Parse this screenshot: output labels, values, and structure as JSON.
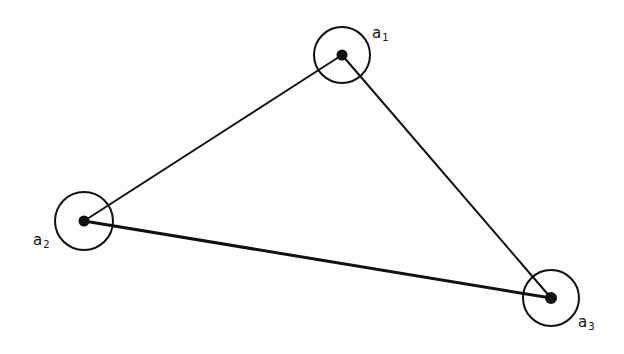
{
  "diagram": {
    "type": "triangle-graph",
    "stroke_color": "#111111",
    "background": "#ffffff",
    "nodes": [
      {
        "id": "a1",
        "base": "a",
        "sub": "1",
        "cx": 342,
        "cy": 55,
        "r": 28,
        "label_x": 372,
        "label_y": 26
      },
      {
        "id": "a2",
        "base": "a",
        "sub": "2",
        "cx": 84,
        "cy": 221,
        "r": 29,
        "label_x": 33,
        "label_y": 233
      },
      {
        "id": "a3",
        "base": "a",
        "sub": "3",
        "cx": 551,
        "cy": 298,
        "r": 28,
        "label_x": 578,
        "label_y": 315
      }
    ],
    "edges": [
      {
        "from": "a1",
        "to": "a2"
      },
      {
        "from": "a1",
        "to": "a3"
      },
      {
        "from": "a2",
        "to": "a3"
      }
    ]
  }
}
